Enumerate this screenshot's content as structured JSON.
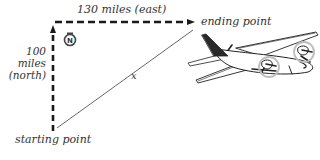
{
  "diagram": {
    "type": "right-triangle-navigation",
    "labels": {
      "east_leg": "130 miles (east)",
      "north_leg_line1": "100",
      "north_leg_line2": "miles",
      "north_leg_line3": "(north)",
      "hypotenuse": "x",
      "start": "starting point",
      "end": "ending point",
      "compass": "N"
    },
    "legs": {
      "east": {
        "distance": 130,
        "unit": "miles",
        "direction": "east"
      },
      "north": {
        "distance": 100,
        "unit": "miles",
        "direction": "north"
      }
    },
    "colors": {
      "dash": "#1a1a1a",
      "hypotenuse": "#555555",
      "text": "#333333",
      "plane_outline": "#222222",
      "plane_tail": "#2a2a2a",
      "propeller_circle": "#bdbdbd"
    }
  }
}
